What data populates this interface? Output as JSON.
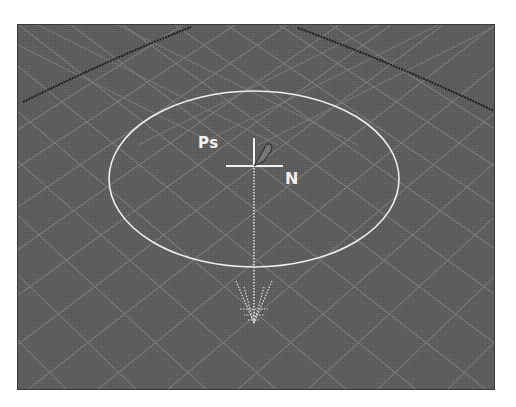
{
  "viewport": {
    "name": "3d-perspective-viewport",
    "background_color": "#5d5d5d",
    "grid_color": "#8c8c8c",
    "horizon_edge_color": "#1e1e1e",
    "gizmo_color": "#f2f2f2"
  },
  "gizmo": {
    "labels": {
      "point": "Ps",
      "normal": "N"
    },
    "shape": "circle-radius-with-normal-arrow",
    "icons": [
      "crosshair-icon",
      "pen-tip-icon",
      "down-arrow-icon"
    ]
  }
}
